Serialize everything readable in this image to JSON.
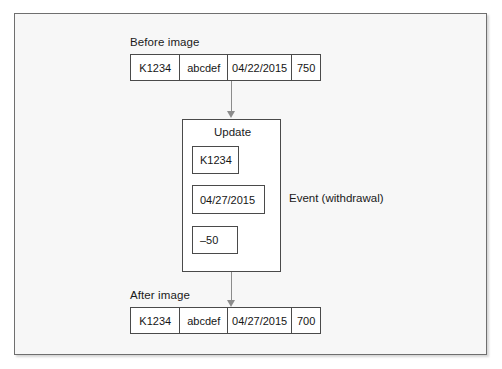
{
  "diagram": {
    "frame": {
      "background_color": "#f7f7f7",
      "border_color": "#6f6f6f"
    },
    "before": {
      "caption": "Before image",
      "cells": [
        "K1234",
        "abcdef",
        "04/22/2015",
        "750"
      ]
    },
    "after": {
      "caption": "After image",
      "cells": [
        "K1234",
        "abcdef",
        "04/27/2015",
        "700"
      ]
    },
    "update": {
      "title": "Update",
      "fields": [
        "K1234",
        "04/27/2015",
        "–50"
      ]
    },
    "annotation": {
      "event_label": "Event (withdrawal)"
    },
    "arrows": [
      {
        "name": "before-to-update",
        "direction": "down"
      },
      {
        "name": "update-to-after",
        "direction": "down"
      }
    ]
  }
}
